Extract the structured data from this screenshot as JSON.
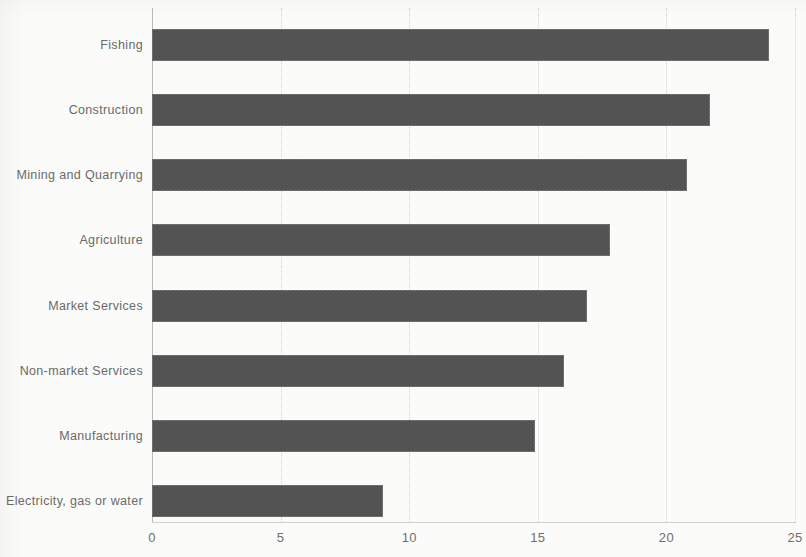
{
  "chart_data": {
    "type": "bar",
    "orientation": "horizontal",
    "title": "",
    "subtitle": "",
    "xlabel": "",
    "ylabel": "",
    "xlim": [
      0,
      25
    ],
    "xticks": [
      "0",
      "5",
      "10",
      "15",
      "20",
      "25"
    ],
    "xtick_values": [
      0,
      5,
      10,
      15,
      20,
      25
    ],
    "grid": true,
    "legend": false,
    "categories": [
      "Fishing",
      "Construction",
      "Mining and Quarrying",
      "Agriculture",
      "Market Services",
      "Non-market Services",
      "Manufacturing",
      "Electricity, gas or water"
    ],
    "values": [
      24.0,
      21.7,
      20.8,
      17.8,
      16.9,
      16.0,
      14.9,
      9.0
    ],
    "series": [
      {
        "name": "",
        "values": [
          24.0,
          21.7,
          20.8,
          17.8,
          16.9,
          16.0,
          14.9,
          9.0
        ]
      }
    ],
    "colors": {
      "bar_fill": "#4f4f4f",
      "bar_border": "#6d6d6d",
      "gridline": "#d2d2d0",
      "axis": "#b9b9b6",
      "label_text": "#6a6a68",
      "background": "#fbfbfa"
    }
  }
}
